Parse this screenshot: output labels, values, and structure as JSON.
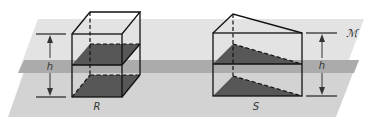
{
  "figure": {
    "plane_label": "ℳ",
    "height_label": "h",
    "solids": [
      {
        "name": "R",
        "label": "R",
        "shape": "rectangular-prism"
      },
      {
        "name": "S",
        "label": "S",
        "shape": "triangular-prism"
      }
    ],
    "colors": {
      "upper_plane": "#e2e2e2",
      "lower_plane": "#d2d2d2",
      "overlap_band": "#ababab",
      "cross_section": "#555555",
      "edges": "#111111"
    }
  }
}
